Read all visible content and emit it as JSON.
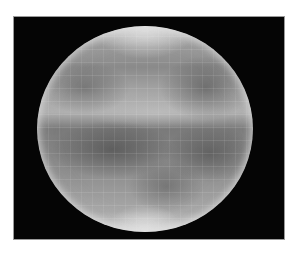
{
  "image": {
    "subject": "grayscale photograph of a planetary disk",
    "background_color": "#ffffff",
    "frame_color": "#050505",
    "disk_tone_light": "#d8d8d8",
    "disk_tone_dark": "#7a7a7a"
  }
}
